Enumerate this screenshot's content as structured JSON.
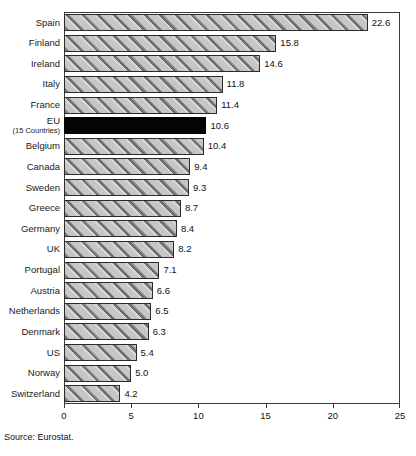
{
  "chart_data": {
    "type": "bar",
    "orientation": "horizontal",
    "title": "",
    "subtitle": "",
    "xlabel": "",
    "ylabel": "",
    "xlim": [
      0,
      25
    ],
    "xticks": [
      "0",
      "5",
      "10",
      "15",
      "20",
      "25"
    ],
    "xtick_values": [
      0,
      5,
      10,
      15,
      20,
      25
    ],
    "grid": false,
    "legend": false,
    "categories": [
      "Spain",
      "Finland",
      "Ireland",
      "Italy",
      "France",
      "EU",
      "Belgium",
      "Canada",
      "Sweden",
      "Greece",
      "Germany",
      "UK",
      "Portugal",
      "Austria",
      "Netherlands",
      "Denmark",
      "US",
      "Norway",
      "Switzerland"
    ],
    "values": [
      22.6,
      15.8,
      14.6,
      11.8,
      11.4,
      10.6,
      10.4,
      9.4,
      9.3,
      8.7,
      8.4,
      8.2,
      7.1,
      6.6,
      6.5,
      6.3,
      5.4,
      5.0,
      4.2
    ],
    "value_labels": [
      "22.6",
      "15.8",
      "14.6",
      "11.8",
      "11.4",
      "10.6",
      "10.4",
      "9.4",
      "9.3",
      "8.7",
      "8.4",
      "8.2",
      "7.1",
      "6.6",
      "6.5",
      "6.3",
      "5.4",
      "5.0",
      "4.2"
    ],
    "bars": [
      {
        "label": "Spain",
        "sublabel": "",
        "value": 22.6,
        "value_label": "22.6",
        "style": "hatched"
      },
      {
        "label": "Finland",
        "sublabel": "",
        "value": 15.8,
        "value_label": "15.8",
        "style": "hatched"
      },
      {
        "label": "Ireland",
        "sublabel": "",
        "value": 14.6,
        "value_label": "14.6",
        "style": "hatched"
      },
      {
        "label": "Italy",
        "sublabel": "",
        "value": 11.8,
        "value_label": "11.8",
        "style": "hatched"
      },
      {
        "label": "France",
        "sublabel": "",
        "value": 11.4,
        "value_label": "11.4",
        "style": "hatched"
      },
      {
        "label": "EU",
        "sublabel": "(15 Countries)",
        "value": 10.6,
        "value_label": "10.6",
        "style": "solid"
      },
      {
        "label": "Belgium",
        "sublabel": "",
        "value": 10.4,
        "value_label": "10.4",
        "style": "hatched"
      },
      {
        "label": "Canada",
        "sublabel": "",
        "value": 9.4,
        "value_label": "9.4",
        "style": "hatched"
      },
      {
        "label": "Sweden",
        "sublabel": "",
        "value": 9.3,
        "value_label": "9.3",
        "style": "hatched"
      },
      {
        "label": "Greece",
        "sublabel": "",
        "value": 8.7,
        "value_label": "8.7",
        "style": "hatched"
      },
      {
        "label": "Germany",
        "sublabel": "",
        "value": 8.4,
        "value_label": "8.4",
        "style": "hatched"
      },
      {
        "label": "UK",
        "sublabel": "",
        "value": 8.2,
        "value_label": "8.2",
        "style": "hatched"
      },
      {
        "label": "Portugal",
        "sublabel": "",
        "value": 7.1,
        "value_label": "7.1",
        "style": "hatched"
      },
      {
        "label": "Austria",
        "sublabel": "",
        "value": 6.6,
        "value_label": "6.6",
        "style": "hatched"
      },
      {
        "label": "Netherlands",
        "sublabel": "",
        "value": 6.5,
        "value_label": "6.5",
        "style": "hatched"
      },
      {
        "label": "Denmark",
        "sublabel": "",
        "value": 6.3,
        "value_label": "6.3",
        "style": "hatched"
      },
      {
        "label": "US",
        "sublabel": "",
        "value": 5.4,
        "value_label": "5.4",
        "style": "hatched"
      },
      {
        "label": "Norway",
        "sublabel": "",
        "value": 5.0,
        "value_label": "5.0",
        "style": "hatched"
      },
      {
        "label": "Switzerland",
        "sublabel": "",
        "value": 4.2,
        "value_label": "4.2",
        "style": "hatched"
      }
    ],
    "colors": {
      "bar_fill": "#c6c6c6",
      "bar_hatch": "#6e6e6e",
      "bar_border": "#2b2b2b",
      "highlight_bar": "#040404",
      "axis": "#3a3a3a",
      "text": "#111111",
      "background": "#ffffff"
    }
  },
  "footer": {
    "source": "Source: Eurostat."
  }
}
